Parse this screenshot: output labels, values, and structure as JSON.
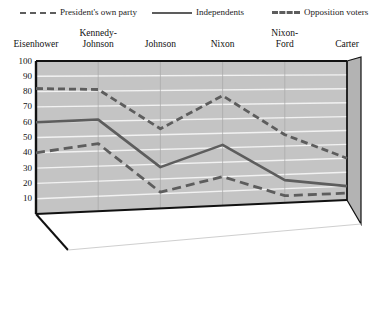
{
  "legend": {
    "items": [
      {
        "label": "President's own party",
        "style": "long-dash",
        "color": "#5d5d5d",
        "icon": "legend-line-dash-icon"
      },
      {
        "label": "Independents",
        "style": "solid",
        "color": "#5d5d5d",
        "icon": "legend-line-solid-icon"
      },
      {
        "label": "Opposition voters",
        "style": "short-dash",
        "color": "#5d5d5d",
        "icon": "legend-line-dotdash-icon"
      }
    ]
  },
  "axes": {
    "y_ticks": [
      "100",
      "90",
      "80",
      "70",
      "60",
      "50",
      "40",
      "30",
      "20",
      "10"
    ],
    "x_labels": [
      "Eisenhower",
      "Kennedy-\nJohnson",
      "Johnson",
      "Nixon",
      "Nixon-\nFord",
      "Carter"
    ]
  },
  "colors": {
    "plot_surface": "#c4c4c4",
    "side_panel": "#b3b3b3",
    "gridline": "#f2f2f2",
    "line": "#5d5d5d",
    "axis": "#111111",
    "background": "#ffffff"
  },
  "chart_data": {
    "type": "line",
    "title": "",
    "subtitle": "",
    "xlabel": "",
    "ylabel": "",
    "ylim": [
      0,
      100
    ],
    "grid": true,
    "legend_position": "top",
    "categories": [
      "Eisenhower",
      "Kennedy-Johnson",
      "Johnson",
      "Nixon",
      "Nixon-Ford",
      "Carter"
    ],
    "series": [
      {
        "name": "President's own party",
        "style": "long-dash",
        "values": [
          40,
          45,
          11,
          20,
          5,
          5
        ]
      },
      {
        "name": "Independents",
        "style": "solid",
        "values": [
          60,
          61,
          28,
          42,
          16,
          10
        ]
      },
      {
        "name": "Opposition voters",
        "style": "short-dash",
        "values": [
          82,
          81,
          54,
          76,
          48,
          30
        ]
      }
    ]
  }
}
